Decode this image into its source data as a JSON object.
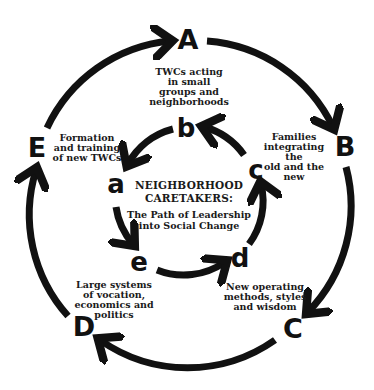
{
  "diagram": {
    "title": "NEIGHBORHOOD\nCARETAKERS:",
    "subtitle": "The Path of Leadership\ninto Social Change",
    "colors": {
      "stroke": "#111111",
      "background": "#ffffff",
      "text": "#1a1a1a"
    },
    "outer_cycle": {
      "nodes": [
        {
          "id": "A",
          "label": "A",
          "caption": "TWCs acting\nin small\ngroups and\nneighborhoods"
        },
        {
          "id": "B",
          "label": "B",
          "caption": "Families\nintegrating the\nold and the new"
        },
        {
          "id": "C",
          "label": "C",
          "caption": "New operating\nmethods, styles\nand wisdom"
        },
        {
          "id": "D",
          "label": "D",
          "caption": "Large systems\nof vocation,\neconomics and\npolitics"
        },
        {
          "id": "E",
          "label": "E",
          "caption": "Formation\nand training\nof new TWCs"
        }
      ],
      "direction": "clockwise",
      "edges": [
        "E→A",
        "A→B",
        "B→C",
        "C→D",
        "D→E"
      ]
    },
    "inner_cycle": {
      "nodes": [
        {
          "id": "a",
          "label": "a"
        },
        {
          "id": "b",
          "label": "b"
        },
        {
          "id": "c",
          "label": "c"
        },
        {
          "id": "d",
          "label": "d"
        },
        {
          "id": "e",
          "label": "e"
        }
      ],
      "direction": "counter-clockwise",
      "edges": [
        "a→e",
        "e→d",
        "d→c",
        "c→b",
        "b→a"
      ]
    }
  }
}
